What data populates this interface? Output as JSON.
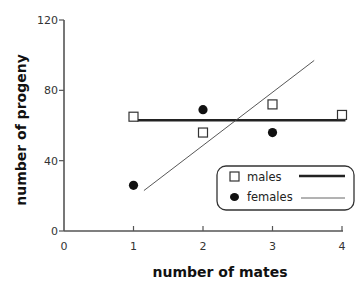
{
  "chart_data": {
    "type": "scatter",
    "title": "",
    "xlabel": "number of mates",
    "ylabel": "number of progeny",
    "xlim": [
      0,
      4
    ],
    "ylim": [
      0,
      120
    ],
    "x_ticks": [
      "0",
      "1",
      "2",
      "3",
      "4"
    ],
    "y_ticks": [
      "0",
      "40",
      "80",
      "120"
    ],
    "grid": false,
    "legend_position": "lower right",
    "series": [
      {
        "name": "males",
        "marker": "open-square",
        "x": [
          1,
          2,
          3,
          4
        ],
        "values": [
          65,
          56,
          72,
          66
        ],
        "fit_line": {
          "style": "thick",
          "x": [
            1.05,
            4.05
          ],
          "y": [
            63,
            63
          ]
        }
      },
      {
        "name": "females",
        "marker": "filled-circle",
        "x": [
          1,
          2,
          3,
          4
        ],
        "values": [
          26,
          69,
          56,
          null
        ],
        "fit_line": {
          "style": "thin",
          "x": [
            1.15,
            3.6
          ],
          "y": [
            23,
            97
          ]
        }
      }
    ]
  },
  "legend": {
    "items": [
      {
        "label": "males"
      },
      {
        "label": "females"
      }
    ]
  }
}
